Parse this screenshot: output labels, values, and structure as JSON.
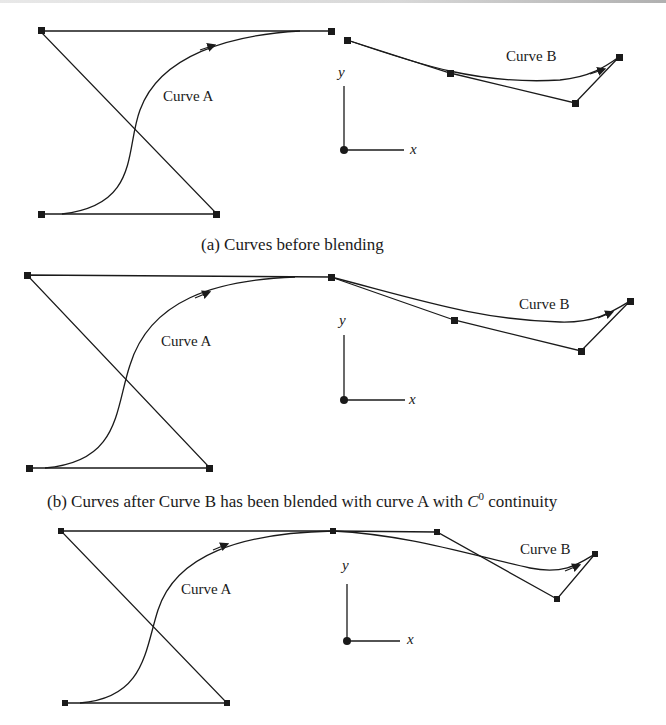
{
  "figure": {
    "panels": [
      {
        "id": "a",
        "caption": "(a) Curves before blending",
        "curve_a_label": "Curve A",
        "curve_b_label": "Curve B",
        "axis_x_label": "x",
        "axis_y_label": "y"
      },
      {
        "id": "b",
        "caption_prefix": "(b) Curves after Curve B has been blended with curve A with ",
        "caption_math": "C",
        "caption_sup": "0",
        "caption_suffix": " continuity",
        "curve_a_label": "Curve A",
        "curve_b_label": "Curve B",
        "axis_x_label": "x",
        "axis_y_label": "y"
      },
      {
        "id": "c",
        "curve_a_label": "Curve A",
        "curve_b_label": "Curve B",
        "axis_x_label": "x",
        "axis_y_label": "y"
      }
    ],
    "colors": {
      "stroke": "#1a1a1a",
      "background": "#ffffff"
    }
  }
}
